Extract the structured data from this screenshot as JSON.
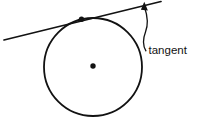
{
  "figure": {
    "kind": "geometry-diagram",
    "background_color": "#ffffff",
    "ink_color": "#121212",
    "width": 200,
    "height": 117
  },
  "labels": {
    "tangent": "tangent"
  },
  "geometry": {
    "circle": {
      "name": "circle",
      "cx": 93,
      "cy": 67,
      "r": 49,
      "stroke_width": 1.8
    },
    "center_point": {
      "name": "center-point",
      "cx": 93,
      "cy": 66,
      "r": 2.6
    },
    "tangent_point": {
      "name": "tangent-point",
      "cx": 81.5,
      "cy": 19.3,
      "r": 2.6
    },
    "tangent_line": {
      "name": "tangent-line",
      "x1": 4,
      "y1": 40,
      "x2": 161,
      "y2": 1.5,
      "stroke_width": 1.7
    },
    "leader": {
      "name": "leader-line",
      "path": "M 144.5 6 C 147.5 16, 148.5 24, 145.5 32 C 142.8 39, 142.6 45, 145.8 50.5",
      "stroke_width": 1.3,
      "arrow_points": "144.6,2.2 141.2,9.6 147.6,10.2"
    },
    "label_position": {
      "name": "tangent-label",
      "x": 148.5,
      "y": 53.5
    }
  }
}
